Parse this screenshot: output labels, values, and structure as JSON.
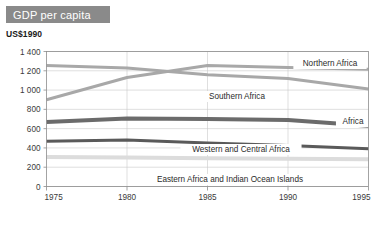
{
  "header": {
    "title": "GDP per capita",
    "title_banner_color": "#8a8a8a",
    "unit_label": "US$1990"
  },
  "chart_data": {
    "type": "line",
    "title": "GDP per capita",
    "subtitle": "US$1990",
    "xlabel": "",
    "ylabel": "US$1990",
    "x": [
      1975,
      1980,
      1985,
      1990,
      1995
    ],
    "xtick_labels": [
      "1975",
      "1980",
      "1985",
      "1990",
      "1995"
    ],
    "xlim": [
      1975,
      1995
    ],
    "ylim": [
      0,
      1400
    ],
    "yticks": [
      0,
      200,
      400,
      600,
      800,
      1000,
      1200,
      1400
    ],
    "ytick_labels": [
      "0",
      "200",
      "400",
      "600",
      "800",
      "1 000",
      "1 200",
      "1 400"
    ],
    "grid": true,
    "legend": "inline-labels",
    "series": [
      {
        "name": "Northern Africa",
        "color": "#a8a8a8",
        "values": [
          900,
          1130,
          1255,
          1235,
          1215
        ]
      },
      {
        "name": "Southern Africa",
        "color": "#a8a8a8",
        "values": [
          1255,
          1230,
          1160,
          1120,
          1010
        ]
      },
      {
        "name": "Africa",
        "color": "#6b6b6b",
        "values": [
          670,
          705,
          700,
          690,
          630
        ]
      },
      {
        "name": "Western and Central Africa",
        "color": "#5a5a5a",
        "values": [
          468,
          482,
          450,
          425,
          392
        ]
      },
      {
        "name": "Eastern Africa and Indian Ocean Islands",
        "color": "#dcdcdc",
        "values": [
          305,
          300,
          292,
          288,
          282
        ]
      }
    ],
    "annotations": [
      {
        "text": "Northern Africa",
        "series": "Northern Africa"
      },
      {
        "text": "Southern Africa",
        "series": "Southern Africa"
      },
      {
        "text": "Africa",
        "series": "Africa"
      },
      {
        "text": "Western and Central Africa",
        "series": "Western and Central Africa"
      },
      {
        "text": "Eastern Africa and Indian Ocean Islands",
        "series": "Eastern Africa and Indian Ocean Islands"
      }
    ]
  }
}
